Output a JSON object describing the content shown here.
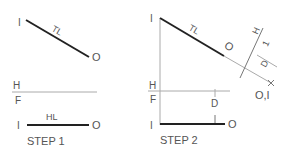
{
  "step1": {
    "caption": "STEP 1",
    "top_view": {
      "end_a": "I",
      "end_b": "O",
      "line_label": "TL"
    },
    "fold_line": {
      "upper": "H",
      "lower": "F"
    },
    "front_view": {
      "end_a": "I",
      "end_b": "O",
      "line_label": "HL"
    }
  },
  "step2": {
    "caption": "STEP 2",
    "top_view": {
      "end_a": "I",
      "end_b": "O",
      "line_label": "TL"
    },
    "fold_line": {
      "upper": "H",
      "lower": "F"
    },
    "front_view": {
      "end_a": "I",
      "end_b": "O"
    },
    "distance_label_front": "D",
    "aux_fold_line": {
      "label_near": "H",
      "label_far": "1"
    },
    "distance_label_aux": "D",
    "point_view_label": "O,I"
  }
}
